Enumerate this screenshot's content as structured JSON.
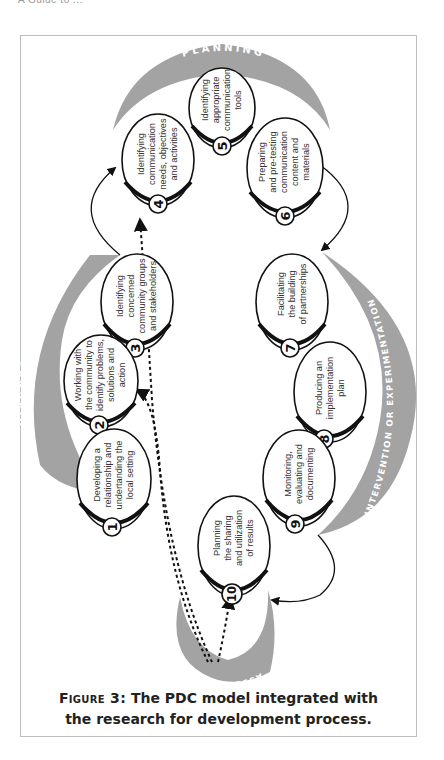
{
  "page_header": "A Guide to ...",
  "figure": {
    "label": "Figure 3:",
    "caption_line1": "The PDC model integrated with",
    "caption_line2": "the research for development process."
  },
  "phases": {
    "planning": "PLANNING",
    "diagnosis": "DIAGNOSIS",
    "intervention": "INTERVENTION OR EXPERIMENTATION",
    "assessment": "ASSESSMENT"
  },
  "steps": [
    {
      "num": "1",
      "lines": [
        "Developing a",
        "relationship and",
        "undertanding the",
        "local setting"
      ]
    },
    {
      "num": "2",
      "lines": [
        "Working with",
        "the community to",
        "identify problems,",
        "solutions and",
        "action"
      ]
    },
    {
      "num": "3",
      "lines": [
        "Identifying",
        "concerned",
        "community groups",
        "and stakeholders"
      ]
    },
    {
      "num": "4",
      "lines": [
        "Identifying",
        "communication",
        "needs, objectives",
        "and activities"
      ]
    },
    {
      "num": "5",
      "lines": [
        "Identifying",
        "appropriate",
        "communication",
        "tools"
      ]
    },
    {
      "num": "6",
      "lines": [
        "Preparing",
        "and pre-testing",
        "communication",
        "content and",
        "materials"
      ]
    },
    {
      "num": "7",
      "lines": [
        "Facilitating",
        "the building",
        "of partnerships"
      ]
    },
    {
      "num": "8",
      "lines": [
        "Producing an",
        "implementation",
        "plan"
      ]
    },
    {
      "num": "9",
      "lines": [
        "Monitoring,",
        "evaluating and",
        "documenting"
      ]
    },
    {
      "num": "10",
      "lines": [
        "Planning",
        "the sharing",
        "and utilization",
        "of results"
      ]
    }
  ],
  "colors": {
    "phase_arc": "#a3a3a3",
    "outline": "#111111",
    "text": "#333333"
  }
}
